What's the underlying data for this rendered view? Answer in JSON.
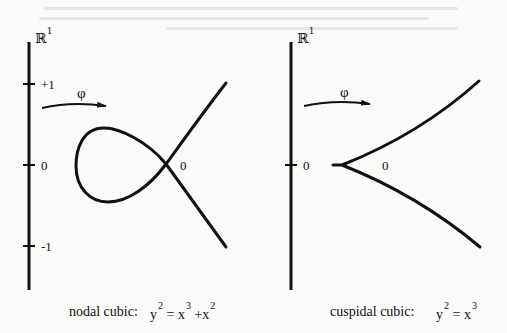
{
  "figure": {
    "left_panel": {
      "axis_label": "ℝ",
      "axis_label_sup": "1",
      "ticks": [
        {
          "label": "+1",
          "y": 84
        },
        {
          "label": "0",
          "y": 165
        },
        {
          "label": "-1",
          "y": 246
        }
      ],
      "map_label": "φ",
      "node_label": "0",
      "caption": "nodal cubic:",
      "equation": {
        "lhs_base": "y",
        "lhs_exp": "2",
        "eq": "=",
        "t1_base": "x",
        "t1_exp": "3",
        "plus": "+",
        "t2_base": "x",
        "t2_exp": "2"
      }
    },
    "right_panel": {
      "axis_label": "ℝ",
      "axis_label_sup": "1",
      "ticks": [
        {
          "label": "0",
          "y": 165
        }
      ],
      "map_label": "φ",
      "cusp_label": "0",
      "caption": "cuspidal cubic:",
      "equation": {
        "lhs_base": "y",
        "lhs_exp": "2",
        "eq": "=",
        "rhs_base": "x",
        "rhs_exp": "3"
      }
    },
    "colors": {
      "ink": "#111111",
      "paper": "#fbfbf9"
    }
  }
}
